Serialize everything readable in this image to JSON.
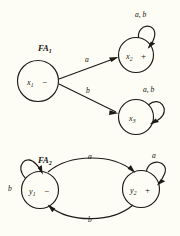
{
  "figure": {
    "background_color": "#fdfdf5",
    "ink_color": "#1d1a17",
    "automata": [
      {
        "id": "FA1",
        "title": "FA",
        "title_subscript": "1",
        "states": [
          {
            "id": "x1",
            "name": "x",
            "subscript": "1",
            "marker": "−",
            "kind": "start"
          },
          {
            "id": "x2",
            "name": "x",
            "subscript": "2",
            "marker": "+",
            "kind": "accept"
          },
          {
            "id": "x3",
            "name": "x",
            "subscript": "3",
            "marker": "",
            "kind": "normal"
          }
        ],
        "transitions": [
          {
            "from": "x1",
            "to": "x2",
            "label": "a",
            "shape": "straight"
          },
          {
            "from": "x1",
            "to": "x3",
            "label": "b",
            "shape": "straight"
          },
          {
            "from": "x2",
            "to": "x2",
            "label": "a, b",
            "shape": "self-loop"
          },
          {
            "from": "x3",
            "to": "x3",
            "label": "a, b",
            "shape": "self-loop"
          }
        ]
      },
      {
        "id": "FA2",
        "title": "FA",
        "title_subscript": "2",
        "states": [
          {
            "id": "y1",
            "name": "y",
            "subscript": "1",
            "marker": "−",
            "kind": "start"
          },
          {
            "id": "y2",
            "name": "y",
            "subscript": "2",
            "marker": "+",
            "kind": "accept"
          }
        ],
        "transitions": [
          {
            "from": "y1",
            "to": "y2",
            "label": "a",
            "shape": "curve-top"
          },
          {
            "from": "y2",
            "to": "y1",
            "label": "b",
            "shape": "curve-bottom"
          },
          {
            "from": "y1",
            "to": "y1",
            "label": "b",
            "shape": "self-loop"
          },
          {
            "from": "y2",
            "to": "y2",
            "label": "a",
            "shape": "self-loop"
          }
        ]
      }
    ]
  },
  "labels": {
    "fa1_title": "FA",
    "fa1_sub": "1",
    "fa2_title": "FA",
    "fa2_sub": "2",
    "x1_name": "x",
    "x1_sub": "1",
    "x1_sign": "−",
    "x2_name": "x",
    "x2_sub": "2",
    "x2_sign": "+",
    "x3_name": "x",
    "x3_sub": "3",
    "y1_name": "y",
    "y1_sub": "1",
    "y1_sign": "−",
    "y2_name": "y",
    "y2_sub": "2",
    "y2_sign": "+",
    "x2_loop": "a, b",
    "x3_loop": "a, b",
    "x1_x2_edge": "a",
    "x1_x3_edge": "b",
    "y1_loop": "b",
    "y2_loop": "a",
    "y1_y2_edge": "a",
    "y2_y1_edge": "b"
  }
}
